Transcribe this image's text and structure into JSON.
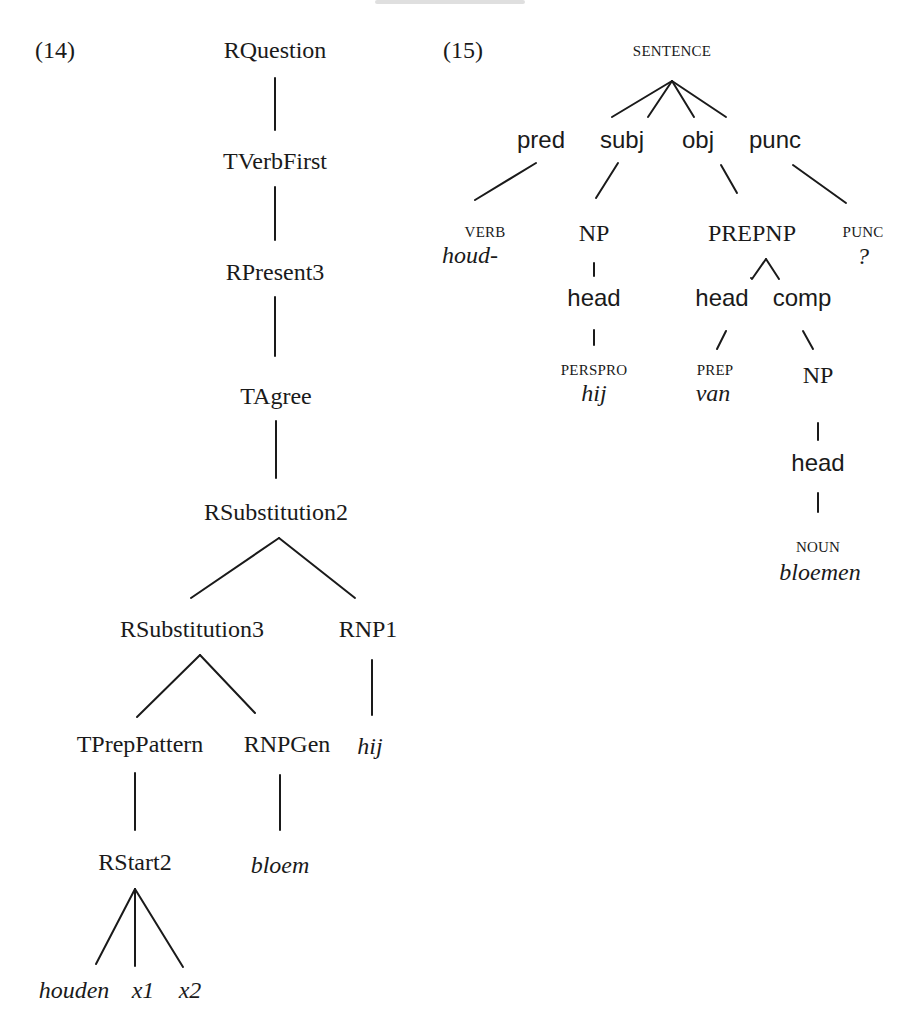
{
  "header": {
    "running_text": ""
  },
  "examples": {
    "ex14": {
      "number": "(14)",
      "nodes": {
        "rquestion": "RQuestion",
        "tverbfirst": "TVerbFirst",
        "rpresent3": "RPresent3",
        "tagree": "TAgree",
        "rsubstitution2": "RSubstitution2",
        "rsubstitution3": "RSubstitution3",
        "rnp1": "RNP1",
        "hij": "hij",
        "tpreppattern": "TPrepPattern",
        "rnpgen": "RNPGen",
        "rstart2": "RStart2",
        "bloem": "bloem",
        "houden": "houden",
        "x1": "x1",
        "x2": "x2"
      }
    },
    "ex15": {
      "number": "(15)",
      "nodes": {
        "sentence": "SENTENCE",
        "pred": "pred",
        "subj": "subj",
        "obj": "obj",
        "punc": "punc",
        "verb_cat": "VERB",
        "verb_word": "houd-",
        "np1": "NP",
        "head1": "head",
        "perspro_cat": "PERSPRO",
        "perspro_word": "hij",
        "prepnp": "PREPNP",
        "punc_cat": "PUNC",
        "punc_word": "?",
        "head2": "head",
        "comp": "comp",
        "prep_cat": "PREP",
        "prep_word": "van",
        "np2": "NP",
        "head3": "head",
        "noun_cat": "NOUN",
        "noun_word": "bloemen"
      }
    }
  }
}
